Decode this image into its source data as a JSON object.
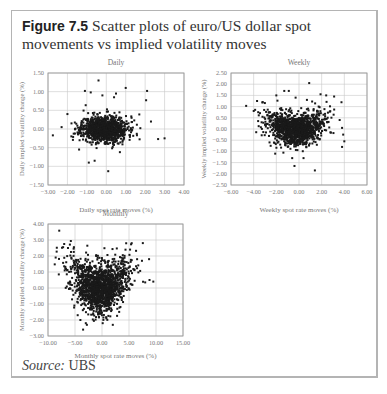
{
  "figure": {
    "label": "Figure 7.5",
    "title": "Scatter plots of euro/US dollar spot movements vs implied volatility moves",
    "source_label": "Source:",
    "source_value": "UBS"
  },
  "colors": {
    "point": "#1a1a1a",
    "grid": "#c8c8c8",
    "frame": "#9a9a9a",
    "text": "#777777"
  },
  "chart_data": [
    {
      "id": "daily",
      "type": "scatter",
      "title": "Daily",
      "xlabel": "Daily spot rate moves (%)",
      "ylabel": "Daily implied volatility change (%)",
      "xlim": [
        -3,
        4
      ],
      "ylim": [
        -1.5,
        1.5
      ],
      "xticks": [
        -3,
        -2,
        -1,
        0,
        1,
        2,
        3,
        4
      ],
      "yticks": [
        -1.5,
        -1,
        -0.5,
        0,
        0.5,
        1,
        1.5
      ],
      "xtick_labels": [
        "−3.00",
        "−2.00",
        "−1.00",
        "0.00",
        "1.00",
        "2.00",
        "3.00",
        "4.00"
      ],
      "ytick_labels": [
        "−1.50",
        "−1.00",
        "−0.50",
        "0.00",
        "0.50",
        "1.00",
        "1.50"
      ],
      "grid": true,
      "cluster": {
        "n": 1100,
        "x_center": -0.1,
        "x_sd": 0.6,
        "y_center": 0.0,
        "y_sd": 0.17,
        "seed": 11
      },
      "outliers": [
        [
          -0.4,
          1.3
        ],
        [
          1.0,
          1.1
        ],
        [
          2.1,
          1.02
        ],
        [
          -1.1,
          1.02
        ],
        [
          -0.8,
          0.98
        ],
        [
          0.5,
          0.95
        ],
        [
          2.05,
          0.77
        ],
        [
          0.4,
          0.85
        ],
        [
          -0.2,
          0.9
        ],
        [
          -2.75,
          -0.17
        ],
        [
          3.0,
          -0.25
        ],
        [
          0.1,
          -1.13
        ],
        [
          -0.9,
          -0.9
        ],
        [
          -0.6,
          -0.85
        ],
        [
          -2.3,
          0.05
        ],
        [
          -2.0,
          0.4
        ],
        [
          -1.4,
          -0.55
        ],
        [
          0.7,
          -0.62
        ],
        [
          2.3,
          0.2
        ],
        [
          1.7,
          0.39
        ]
      ]
    },
    {
      "id": "weekly",
      "type": "scatter",
      "title": "Weekly",
      "xlabel": "Weekly spot rate moves (%)",
      "ylabel": "Weekly implied volatility change (%)",
      "xlim": [
        -6,
        6
      ],
      "ylim": [
        -2.5,
        2.5
      ],
      "xticks": [
        -6,
        -4,
        -2,
        0,
        2,
        4,
        6
      ],
      "yticks": [
        -2.5,
        -2,
        -1.5,
        -1,
        -0.5,
        0,
        0.5,
        1,
        1.5,
        2,
        2.5
      ],
      "xtick_labels": [
        "−6.00",
        "−4.00",
        "−2.00",
        "0.00",
        "2.00",
        "4.00",
        "6.00"
      ],
      "ytick_labels": [
        "−2.50",
        "−2.00",
        "−1.50",
        "−1.00",
        "−0.50",
        "0.00",
        "0.50",
        "1.00",
        "1.50",
        "2.00",
        "2.50"
      ],
      "grid": true,
      "cluster": {
        "n": 1300,
        "x_center": -0.3,
        "x_sd": 1.2,
        "y_center": -0.05,
        "y_sd": 0.35,
        "smile": 0.06,
        "seed": 23
      },
      "outliers": [
        [
          0.9,
          2.05
        ],
        [
          -1.3,
          1.7
        ],
        [
          -0.9,
          1.7
        ],
        [
          -3.7,
          1.25
        ],
        [
          -3.2,
          1.2
        ],
        [
          -2.0,
          1.5
        ],
        [
          2.4,
          1.5
        ],
        [
          3.1,
          1.45
        ],
        [
          1.9,
          1.55
        ],
        [
          -0.3,
          1.4
        ],
        [
          0.7,
          1.3
        ],
        [
          3.8,
          0.05
        ],
        [
          3.9,
          -0.25
        ],
        [
          4.0,
          -0.55
        ],
        [
          3.8,
          -0.8
        ],
        [
          -0.4,
          -1.65
        ],
        [
          1.4,
          -1.85
        ],
        [
          -0.6,
          -1.3
        ],
        [
          -2.5,
          -0.75
        ],
        [
          -2.1,
          -1.1
        ],
        [
          -3.6,
          0.75
        ],
        [
          -3.3,
          0.3
        ],
        [
          0.4,
          -1.3
        ]
      ]
    },
    {
      "id": "monthly",
      "type": "scatter",
      "title": "Monthly",
      "xlabel": "Monthly spot rate moves (%)",
      "ylabel": "Monthly implied volatility change (%)",
      "xlim": [
        -10,
        15
      ],
      "ylim": [
        -3,
        4
      ],
      "xticks": [
        -10,
        -5,
        0,
        5,
        10,
        15
      ],
      "yticks": [
        -3,
        -2,
        -1,
        0,
        1,
        2,
        3,
        4
      ],
      "xtick_labels": [
        "−10.00",
        "−5.00",
        "0.00",
        "5.00",
        "10.00",
        "15.00"
      ],
      "ytick_labels": [
        "−3.00",
        "−2.00",
        "−1.00",
        "0.00",
        "1.00",
        "2.00",
        "3.00",
        "4.00"
      ],
      "grid": true,
      "cluster": {
        "n": 1600,
        "x_center": -0.3,
        "x_sd": 2.6,
        "y_center": -0.05,
        "y_sd": 0.75,
        "smile": 0.035,
        "seed": 37
      },
      "outliers": [
        [
          -7.0,
          2.75
        ],
        [
          -7.2,
          2.55
        ],
        [
          -6.3,
          2.5
        ],
        [
          -5.2,
          2.55
        ],
        [
          5.5,
          2.8
        ],
        [
          5.2,
          2.4
        ],
        [
          -8.0,
          0.85
        ],
        [
          -3.5,
          -2.6
        ],
        [
          -2.8,
          -2.3
        ],
        [
          -4.5,
          -1.7
        ],
        [
          9.5,
          0.4
        ],
        [
          8.8,
          0.5
        ],
        [
          8.0,
          0.35
        ],
        [
          7.4,
          1.7
        ],
        [
          6.5,
          1.8
        ],
        [
          -4.0,
          -2.0
        ],
        [
          -3.0,
          -2.2
        ]
      ]
    }
  ]
}
